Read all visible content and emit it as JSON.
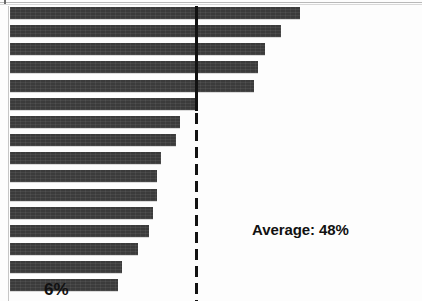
{
  "chart_data": {
    "type": "bar",
    "orientation": "horizontal",
    "title": "",
    "subtitle": "",
    "xlabel": "",
    "ylabel": "",
    "categories": [
      "",
      "",
      "",
      "",
      "",
      "",
      "",
      "",
      "",
      "",
      "",
      "",
      "",
      "",
      "",
      ""
    ],
    "values": [
      75,
      70,
      66,
      64,
      63,
      48,
      44,
      43,
      39,
      38,
      38,
      37,
      36,
      33,
      29,
      28
    ],
    "value_suffix": "%",
    "xlim": [
      0,
      100
    ],
    "grid": false,
    "legend": false,
    "series": [
      {
        "name": "Percent",
        "values": [
          75,
          70,
          66,
          64,
          63,
          48,
          44,
          43,
          39,
          38,
          38,
          37,
          36,
          33,
          29,
          28
        ]
      }
    ],
    "bar_color": "#3b3b3b",
    "annotations": [
      {
        "name": "average-reference-line",
        "type": "vline",
        "value": 48,
        "label": "Average: 48%",
        "style": "dashed",
        "color": "#121212"
      },
      {
        "name": "minimum-value-label",
        "type": "point-label",
        "value": 6,
        "label": "6%"
      }
    ]
  },
  "labels": {
    "average": "Average: 48%",
    "minimum": "6%"
  },
  "colors": {
    "bar": "#3b3b3b",
    "line": "#121212",
    "background": "#fdfdfd",
    "axis": "#c6c6c6"
  }
}
